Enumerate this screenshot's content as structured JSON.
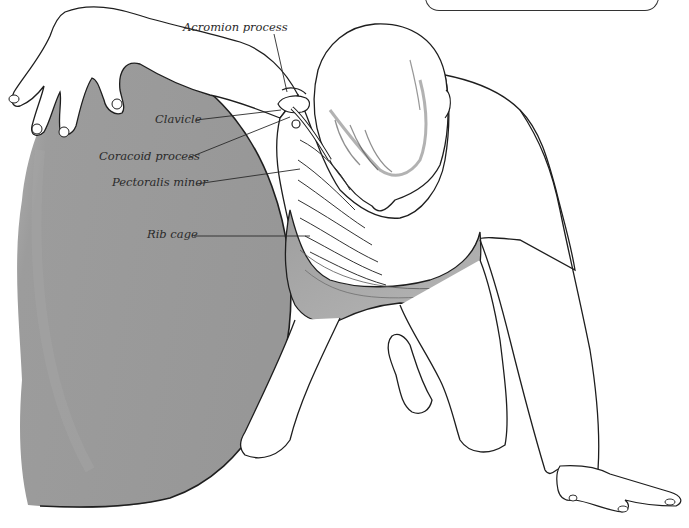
{
  "figure": {
    "colors": {
      "ball_fill": "#9a9a9a",
      "ball_fill_light": "#b4b4b4",
      "shorts_fill": "#a8a8a8",
      "outline": "#1e1e1e",
      "leader_line": "#2a2a2a",
      "background": "#ffffff"
    }
  },
  "labels": [
    {
      "id": "acromion",
      "text": "Acromion process"
    },
    {
      "id": "clavicle",
      "text": "Clavicle"
    },
    {
      "id": "coracoid",
      "text": "Coracoid process"
    },
    {
      "id": "pectoralis",
      "text": "Pectoralis minor"
    },
    {
      "id": "ribcage",
      "text": "Rib cage"
    }
  ],
  "caption_box": {
    "text": ""
  }
}
